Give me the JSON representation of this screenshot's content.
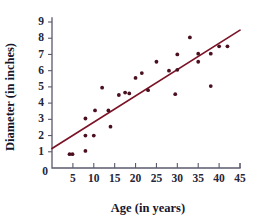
{
  "chart_data": {
    "type": "scatter",
    "title": "",
    "xlabel": "Age (in years)",
    "ylabel": "Diameter (in inches)",
    "xlim": [
      0,
      45
    ],
    "ylim": [
      0,
      9
    ],
    "xticks": [
      5,
      10,
      15,
      20,
      25,
      30,
      35,
      40,
      45
    ],
    "yticks": [
      1,
      2,
      3,
      4,
      5,
      6,
      7,
      8,
      9
    ],
    "origin_label": "0",
    "grid": false,
    "legend": null,
    "point_color": "#4a1020",
    "line_color": "#7b1225",
    "axis_color": "#5a5a6e",
    "series": [
      {
        "name": "Tree measurements",
        "type": "scatter",
        "points": [
          [
            4.2,
            0.85
          ],
          [
            4.9,
            0.85
          ],
          [
            8.0,
            1.05
          ],
          [
            8.0,
            2.0
          ],
          [
            8.0,
            3.05
          ],
          [
            10.0,
            2.0
          ],
          [
            10.3,
            3.55
          ],
          [
            12.0,
            4.95
          ],
          [
            13.5,
            3.55
          ],
          [
            14.0,
            2.55
          ],
          [
            16.0,
            4.5
          ],
          [
            17.5,
            4.65
          ],
          [
            18.5,
            4.6
          ],
          [
            20.0,
            5.55
          ],
          [
            21.5,
            5.85
          ],
          [
            23.0,
            4.8
          ],
          [
            25.0,
            6.55
          ],
          [
            28.0,
            6.0
          ],
          [
            29.5,
            4.55
          ],
          [
            30.0,
            7.0
          ],
          [
            30.0,
            6.05
          ],
          [
            33.0,
            8.05
          ],
          [
            35.0,
            6.55
          ],
          [
            35.0,
            7.05
          ],
          [
            38.0,
            5.05
          ],
          [
            38.0,
            7.05
          ],
          [
            40.0,
            7.5
          ],
          [
            42.0,
            7.5
          ]
        ]
      },
      {
        "name": "Line of best fit",
        "type": "line",
        "points": [
          [
            0,
            1.2
          ],
          [
            45,
            8.5
          ]
        ]
      }
    ]
  }
}
